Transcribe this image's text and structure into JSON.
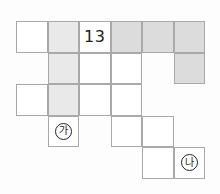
{
  "grid": {
    "origin_x": 16,
    "origin_y": 21,
    "cell_size": 31.5,
    "colors": {
      "white": "#ffffff",
      "light": "#e9e9e9",
      "gray": "#dcdcdc",
      "border": "#a9a9a9"
    },
    "cells": [
      {
        "row": 0,
        "col": 0,
        "fill": "white",
        "label": ""
      },
      {
        "row": 0,
        "col": 1,
        "fill": "light",
        "label": ""
      },
      {
        "row": 0,
        "col": 2,
        "fill": "white",
        "label": "13",
        "kind": "number"
      },
      {
        "row": 0,
        "col": 3,
        "fill": "gray",
        "label": ""
      },
      {
        "row": 0,
        "col": 4,
        "fill": "gray",
        "label": ""
      },
      {
        "row": 0,
        "col": 5,
        "fill": "gray",
        "label": ""
      },
      {
        "row": 1,
        "col": 1,
        "fill": "light",
        "label": ""
      },
      {
        "row": 1,
        "col": 2,
        "fill": "white",
        "label": ""
      },
      {
        "row": 1,
        "col": 3,
        "fill": "white",
        "label": ""
      },
      {
        "row": 1,
        "col": 5,
        "fill": "gray",
        "label": ""
      },
      {
        "row": 2,
        "col": 0,
        "fill": "white",
        "label": ""
      },
      {
        "row": 2,
        "col": 1,
        "fill": "light",
        "label": ""
      },
      {
        "row": 2,
        "col": 2,
        "fill": "white",
        "label": ""
      },
      {
        "row": 2,
        "col": 3,
        "fill": "white",
        "label": ""
      },
      {
        "row": 3,
        "col": 1,
        "fill": "white",
        "label": "가",
        "kind": "circle"
      },
      {
        "row": 3,
        "col": 3,
        "fill": "white",
        "label": ""
      },
      {
        "row": 3,
        "col": 4,
        "fill": "white",
        "label": ""
      },
      {
        "row": 4,
        "col": 4,
        "fill": "white",
        "label": ""
      },
      {
        "row": 4,
        "col": 5,
        "fill": "white",
        "label": "나",
        "kind": "circle"
      }
    ]
  }
}
